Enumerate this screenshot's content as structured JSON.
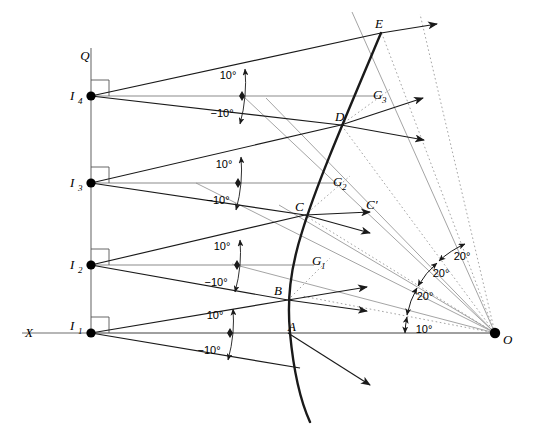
{
  "figure": {
    "type": "geometric-ray-diagram",
    "background_color": "#ffffff",
    "stroke_color": "#1a1a1a",
    "gray_color": "#8c8c8c",
    "width": 538,
    "height": 440
  },
  "axes": {
    "x_axis_label": "X",
    "vertical_axis_label": "Q"
  },
  "source_points": [
    {
      "label": "I",
      "sub": "4",
      "x": 91,
      "y": 96
    },
    {
      "label": "I",
      "sub": "3",
      "x": 91,
      "y": 183
    },
    {
      "label": "I",
      "sub": "2",
      "x": 91,
      "y": 265
    },
    {
      "label": "I",
      "sub": "1",
      "x": 91,
      "y": 333
    }
  ],
  "curve_points": [
    {
      "label": "A",
      "x": 292,
      "y": 330
    },
    {
      "label": "B",
      "x": 288,
      "y": 300
    },
    {
      "label": "C",
      "x": 305,
      "y": 215
    },
    {
      "label": "D",
      "x": 341,
      "y": 125
    },
    {
      "label": "E",
      "x": 381,
      "y": 33
    }
  ],
  "g_points": [
    {
      "label": "G",
      "sub": "1",
      "x": 314,
      "y": 262
    },
    {
      "label": "G",
      "sub": "2",
      "x": 337,
      "y": 182
    },
    {
      "label": "G",
      "sub": "3",
      "x": 378,
      "y": 95
    }
  ],
  "reflected_points": [
    {
      "label": "C′",
      "x": 372,
      "y": 206
    }
  ],
  "origin_point": {
    "label": "O",
    "x": 495,
    "y": 333
  },
  "incident_angle_labels": [
    {
      "text": "10°",
      "x": 228,
      "y": 79
    },
    {
      "text": "−10°",
      "x": 222,
      "y": 114
    },
    {
      "text": "10°",
      "x": 224,
      "y": 171
    },
    {
      "text": "−10°",
      "x": 218,
      "y": 200
    },
    {
      "text": "10°",
      "x": 222,
      "y": 253
    },
    {
      "text": "−10°",
      "x": 216,
      "y": 283
    },
    {
      "text": "10°",
      "x": 215,
      "y": 322
    },
    {
      "text": "−10°",
      "x": 209,
      "y": 351
    }
  ],
  "fan_angle_labels": [
    {
      "text": "10°",
      "x": 424,
      "y": 333
    },
    {
      "text": "20°",
      "x": 425,
      "y": 300
    },
    {
      "text": "20°",
      "x": 439,
      "y": 277
    },
    {
      "text": "20°",
      "x": 460,
      "y": 260
    }
  ],
  "icons": {
    "right_angle_marker": "right-angle-icon",
    "arrow_head": "arrowhead-icon",
    "arc_marker": "angle-arc-icon"
  }
}
